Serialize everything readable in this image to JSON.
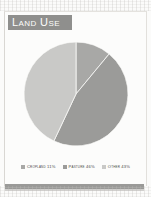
{
  "figure": {
    "title": "Land Use"
  },
  "chart_data": {
    "type": "pie",
    "title": "Land Use",
    "categories": [
      "Cropland",
      "Pasture",
      "Other"
    ],
    "values": [
      11,
      46,
      43
    ],
    "value_unit": "%",
    "labels": [
      "Cropland 11%",
      "Pasture 46%",
      "Other 43%"
    ],
    "colors": [
      "#a8a8a6",
      "#9b9b99",
      "#c9c9c7"
    ],
    "legend_position": "bottom",
    "start_angle_deg": 0,
    "direction": "clockwise",
    "grid": false,
    "slices": [
      {
        "name": "Cropland",
        "value": 11,
        "label": "Cropland 11%",
        "color": "#a8a8a6",
        "start_deg": 0,
        "end_deg": 39.6
      },
      {
        "name": "Pasture",
        "value": 46,
        "label": "Pasture 46%",
        "color": "#9b9b99",
        "start_deg": 39.6,
        "end_deg": 205.2
      },
      {
        "name": "Other",
        "value": 43,
        "label": "Other 43%",
        "color": "#c9c9c7",
        "start_deg": 205.2,
        "end_deg": 360
      }
    ]
  },
  "legend": {
    "items": [
      {
        "label": "Cropland 11%",
        "color": "#a8a8a6"
      },
      {
        "label": "Pasture 46%",
        "color": "#9b9b99"
      },
      {
        "label": "Other 43%",
        "color": "#c9c9c7"
      }
    ]
  }
}
